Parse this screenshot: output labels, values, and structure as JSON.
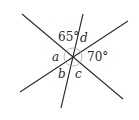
{
  "diagram": {
    "lines": [
      {
        "name": "line-descending"
      },
      {
        "name": "line-ascending"
      },
      {
        "name": "line-steep"
      }
    ],
    "angle_labels": {
      "top": "65°",
      "top_right": "d",
      "left": "a",
      "right": "70°",
      "bottom_left": "b",
      "bottom_right": "c"
    },
    "colors": {
      "line": "#2a2a2a",
      "arc": "#9a9a9a",
      "background": "#ffffff"
    }
  }
}
